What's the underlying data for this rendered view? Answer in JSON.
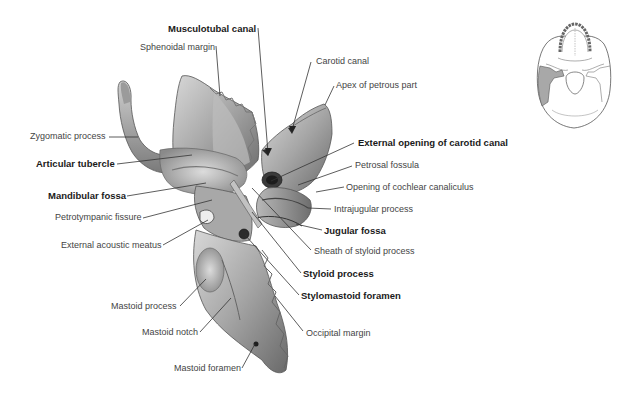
{
  "figure": {
    "colors": {
      "background": "#ffffff",
      "bone_light": "#c9c9c9",
      "bone_mid": "#9a9a9a",
      "bone_dark": "#555555",
      "label_regular": "#444444",
      "label_bold": "#1a1a1a",
      "leader_line": "#333333",
      "highlight_region": "#a8a8a8"
    }
  },
  "labels": [
    {
      "id": "musculotubal-canal",
      "text": "Musculotubal canal",
      "bold": true,
      "x": 168,
      "y": 23,
      "align": "left",
      "line": [
        [
          258,
          28
        ],
        [
          268,
          153
        ]
      ]
    },
    {
      "id": "sphenoidal-margin",
      "text": "Sphenoidal margin",
      "bold": false,
      "x": 140,
      "y": 42,
      "align": "left",
      "line": [
        [
          216,
          46
        ],
        [
          220,
          96
        ]
      ]
    },
    {
      "id": "carotid-canal",
      "text": "Carotid canal",
      "bold": false,
      "x": 316,
      "y": 56,
      "align": "left",
      "line": [
        [
          311,
          62
        ],
        [
          292,
          130
        ]
      ]
    },
    {
      "id": "apex-of-petrous-part",
      "text": "Apex of petrous part",
      "bold": false,
      "x": 336,
      "y": 80,
      "align": "left",
      "line": [
        [
          334,
          86
        ],
        [
          325,
          105
        ]
      ]
    },
    {
      "id": "zygomatic-process",
      "text": "Zygomatic process",
      "bold": false,
      "x": 30,
      "y": 131,
      "align": "left",
      "line": [
        [
          109,
          137
        ],
        [
          138,
          137
        ]
      ]
    },
    {
      "id": "external-opening-of-carotid-canal",
      "text": "External opening of carotid canal",
      "bold": true,
      "x": 358,
      "y": 137,
      "align": "left",
      "line": [
        [
          354,
          143
        ],
        [
          271,
          181
        ]
      ]
    },
    {
      "id": "articular-tubercle",
      "text": "Articular tubercle",
      "bold": true,
      "x": 36,
      "y": 158,
      "align": "left",
      "line": [
        [
          117,
          164
        ],
        [
          192,
          155
        ]
      ]
    },
    {
      "id": "petrosal-fossula",
      "text": "Petrosal fossula",
      "bold": false,
      "x": 355,
      "y": 160,
      "align": "left",
      "line": [
        [
          352,
          166
        ],
        [
          298,
          185
        ]
      ]
    },
    {
      "id": "opening-of-cochlear-canaliculus",
      "text": "Opening of cochlear canaliculus",
      "bold": false,
      "x": 346,
      "y": 182,
      "align": "left",
      "line": [
        [
          344,
          187
        ],
        [
          316,
          192
        ]
      ]
    },
    {
      "id": "mandibular-fossa",
      "text": "Mandibular fossa",
      "bold": true,
      "x": 48,
      "y": 190,
      "align": "left",
      "line": [
        [
          127,
          196
        ],
        [
          206,
          183
        ]
      ]
    },
    {
      "id": "intrajugular-process",
      "text": "Intrajugular process",
      "bold": false,
      "x": 334,
      "y": 204,
      "align": "left",
      "line": [
        [
          331,
          209
        ],
        [
          308,
          208
        ]
      ]
    },
    {
      "id": "petrotympanic-fissure",
      "text": "Petrotympanic fissure",
      "bold": false,
      "x": 55,
      "y": 212,
      "align": "left",
      "line": [
        [
          143,
          218
        ],
        [
          212,
          200
        ]
      ]
    },
    {
      "id": "jugular-fossa",
      "text": "Jugular fossa",
      "bold": true,
      "x": 324,
      "y": 225,
      "align": "left",
      "line": [
        [
          322,
          230
        ],
        [
          296,
          224
        ]
      ]
    },
    {
      "id": "external-acoustic-meatus",
      "text": "External acoustic meatus",
      "bold": false,
      "x": 61,
      "y": 240,
      "align": "left",
      "line": [
        [
          163,
          245
        ],
        [
          208,
          220
        ]
      ]
    },
    {
      "id": "sheath-of-styloid-process",
      "text": "Sheath of styloid process",
      "bold": false,
      "x": 314,
      "y": 246,
      "align": "left",
      "line": [
        [
          311,
          250
        ],
        [
          252,
          188
        ]
      ]
    },
    {
      "id": "styloid-process",
      "text": "Styloid process",
      "bold": true,
      "x": 303,
      "y": 268,
      "align": "left",
      "line": [
        [
          301,
          273
        ],
        [
          252,
          212
        ]
      ]
    },
    {
      "id": "stylomastoid-foramen",
      "text": "Stylomastoid foramen",
      "bold": true,
      "x": 301,
      "y": 290,
      "align": "left",
      "line": [
        [
          299,
          295
        ],
        [
          245,
          235
        ]
      ]
    },
    {
      "id": "mastoid-process",
      "text": "Mastoid process",
      "bold": false,
      "x": 111,
      "y": 301,
      "align": "left",
      "line": [
        [
          180,
          306
        ],
        [
          206,
          279
        ]
      ]
    },
    {
      "id": "occipital-margin",
      "text": "Occipital margin",
      "bold": false,
      "x": 306,
      "y": 328,
      "align": "left",
      "line": [
        [
          303,
          331
        ],
        [
          275,
          296
        ]
      ]
    },
    {
      "id": "mastoid-notch",
      "text": "Mastoid notch",
      "bold": false,
      "x": 142,
      "y": 327,
      "align": "left",
      "line": [
        [
          200,
          332
        ],
        [
          231,
          298
        ]
      ]
    },
    {
      "id": "mastoid-foramen",
      "text": "Mastoid foramen",
      "bold": false,
      "x": 174,
      "y": 363,
      "align": "left",
      "line": [
        [
          242,
          368
        ],
        [
          255,
          344
        ]
      ]
    }
  ],
  "inset": {
    "name": "Skull base orientation thumbnail",
    "highlighted_region": "Temporal bone (left)"
  }
}
